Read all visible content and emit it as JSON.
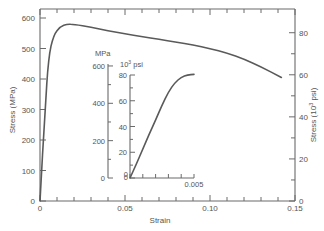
{
  "chart_data": [
    {
      "id": "main",
      "type": "line",
      "title": "",
      "xlabel": "Strain",
      "ylabel": "Stress (MPa)",
      "y2label": "Stress (10³ psi)",
      "xlim": [
        0,
        0.15
      ],
      "ylim": [
        0,
        600
      ],
      "y2lim": [
        0,
        87
      ],
      "grid": false,
      "legend": null,
      "x_ticks": [
        "0",
        "0.05",
        "0.10",
        "0.15"
      ],
      "y_ticks": [
        "0",
        "100",
        "200",
        "300",
        "400",
        "500",
        "600"
      ],
      "y2_ticks": [
        "0",
        "20",
        "40",
        "60",
        "80"
      ],
      "series": [
        {
          "name": "stress-strain",
          "x": [
            0,
            0.003,
            0.005,
            0.008,
            0.012,
            0.016,
            0.02,
            0.03,
            0.04,
            0.05,
            0.06,
            0.07,
            0.08,
            0.09,
            0.1,
            0.11,
            0.12,
            0.13,
            0.142
          ],
          "y": [
            0,
            300,
            470,
            545,
            572,
            580,
            579,
            570,
            558,
            548,
            539,
            530,
            521,
            512,
            500,
            485,
            465,
            440,
            405
          ]
        }
      ]
    },
    {
      "id": "inset",
      "type": "line",
      "title": "",
      "xlabel": "",
      "ylabel": "MPa",
      "y2label": "10³ psi",
      "xlim": [
        0,
        0.005
      ],
      "ylim": [
        0,
        600
      ],
      "y2lim": [
        0,
        80
      ],
      "grid": false,
      "x_ticks": [
        "0",
        "0.005"
      ],
      "y_ticks": [
        "0",
        "200",
        "400",
        "600"
      ],
      "y2_ticks": [
        "0",
        "20",
        "40",
        "60",
        "80"
      ],
      "series": [
        {
          "name": "elastic-region",
          "x": [
            0,
            0.0005,
            0.001,
            0.0015,
            0.002,
            0.0025,
            0.003,
            0.0035,
            0.004,
            0.0045,
            0.005
          ],
          "y": [
            0,
            75,
            155,
            235,
            310,
            390,
            460,
            510,
            540,
            552,
            555
          ]
        }
      ]
    }
  ],
  "labels": {
    "xlabel": "Strain",
    "ylabel": "Stress (MPa)",
    "y2label": "Stress (10³ psi)",
    "inset_ylabel": "MPa",
    "inset_y2label_base": "10",
    "inset_y2label_sup": "3",
    "inset_y2label_unit": " psi"
  },
  "colors": {
    "axis": "#6a6a6a",
    "curve": "#5a5a5a",
    "text": "#555555",
    "background": "#ffffff"
  }
}
